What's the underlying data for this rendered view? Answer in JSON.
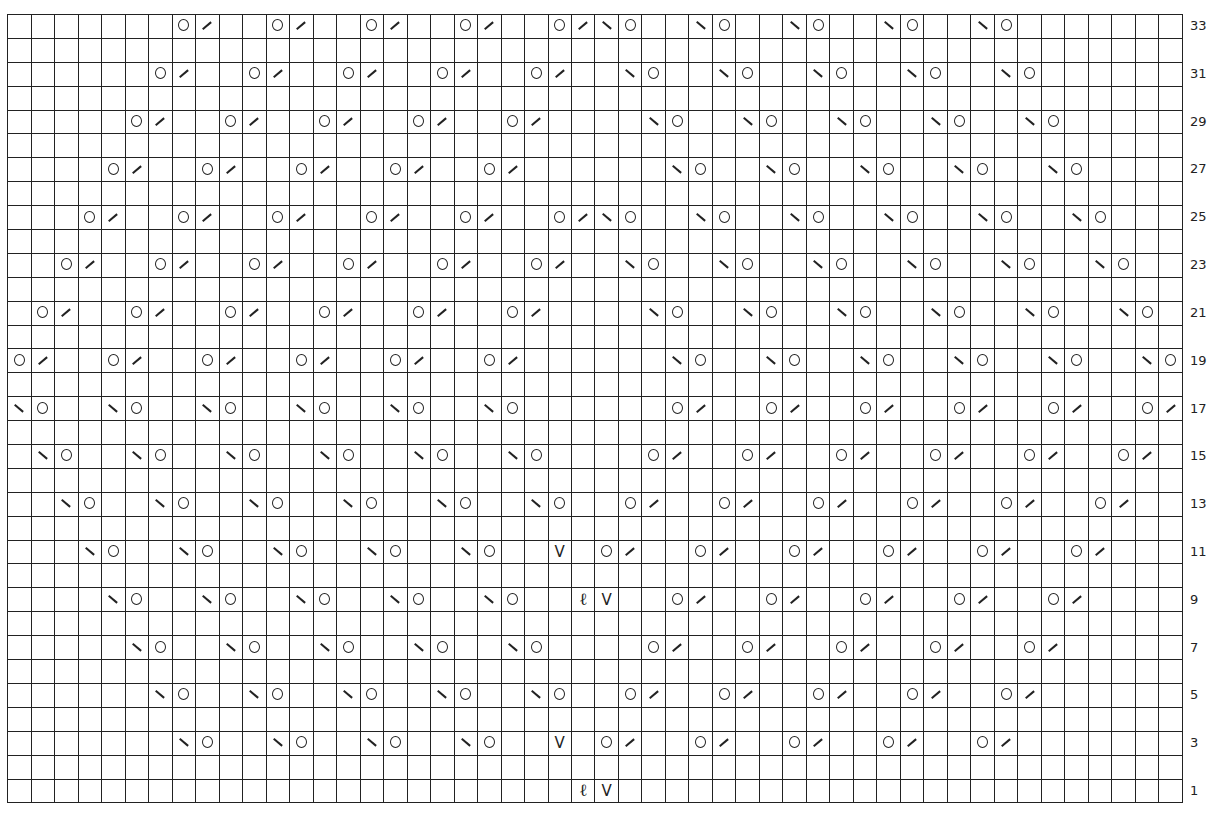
{
  "chart": {
    "type": "knitting-chart",
    "columns": 50,
    "rows": 33,
    "legend_symbols": {
      "o": "yarn-over",
      "/": "k2tog (right-leaning decrease)",
      "\\": "ssk (left-leaning decrease)",
      "V": "slip stitch",
      "ell": "twisted stitch"
    },
    "row_labels": [
      33,
      31,
      29,
      27,
      25,
      23,
      21,
      19,
      17,
      15,
      13,
      11,
      9,
      7,
      5,
      3,
      1
    ],
    "symbols": {
      "33": [
        [
          7,
          "o"
        ],
        [
          8,
          "/"
        ],
        [
          11,
          "o"
        ],
        [
          12,
          "/"
        ],
        [
          15,
          "o"
        ],
        [
          16,
          "/"
        ],
        [
          19,
          "o"
        ],
        [
          20,
          "/"
        ],
        [
          23,
          "o"
        ],
        [
          24,
          "/"
        ],
        [
          25,
          "\\"
        ],
        [
          26,
          "o"
        ],
        [
          29,
          "\\"
        ],
        [
          30,
          "o"
        ],
        [
          33,
          "\\"
        ],
        [
          34,
          "o"
        ],
        [
          37,
          "\\"
        ],
        [
          38,
          "o"
        ],
        [
          41,
          "\\"
        ],
        [
          42,
          "o"
        ]
      ],
      "31": [
        [
          6,
          "o"
        ],
        [
          7,
          "/"
        ],
        [
          10,
          "o"
        ],
        [
          11,
          "/"
        ],
        [
          14,
          "o"
        ],
        [
          15,
          "/"
        ],
        [
          18,
          "o"
        ],
        [
          19,
          "/"
        ],
        [
          22,
          "o"
        ],
        [
          23,
          "/"
        ],
        [
          26,
          "\\"
        ],
        [
          27,
          "o"
        ],
        [
          30,
          "\\"
        ],
        [
          31,
          "o"
        ],
        [
          34,
          "\\"
        ],
        [
          35,
          "o"
        ],
        [
          38,
          "\\"
        ],
        [
          39,
          "o"
        ],
        [
          42,
          "\\"
        ],
        [
          43,
          "o"
        ]
      ],
      "29": [
        [
          5,
          "o"
        ],
        [
          6,
          "/"
        ],
        [
          9,
          "o"
        ],
        [
          10,
          "/"
        ],
        [
          13,
          "o"
        ],
        [
          14,
          "/"
        ],
        [
          17,
          "o"
        ],
        [
          18,
          "/"
        ],
        [
          21,
          "o"
        ],
        [
          22,
          "/"
        ],
        [
          27,
          "\\"
        ],
        [
          28,
          "o"
        ],
        [
          31,
          "\\"
        ],
        [
          32,
          "o"
        ],
        [
          35,
          "\\"
        ],
        [
          36,
          "o"
        ],
        [
          39,
          "\\"
        ],
        [
          40,
          "o"
        ],
        [
          43,
          "\\"
        ],
        [
          44,
          "o"
        ]
      ],
      "27": [
        [
          4,
          "o"
        ],
        [
          5,
          "/"
        ],
        [
          8,
          "o"
        ],
        [
          9,
          "/"
        ],
        [
          12,
          "o"
        ],
        [
          13,
          "/"
        ],
        [
          16,
          "o"
        ],
        [
          17,
          "/"
        ],
        [
          20,
          "o"
        ],
        [
          21,
          "/"
        ],
        [
          28,
          "\\"
        ],
        [
          29,
          "o"
        ],
        [
          32,
          "\\"
        ],
        [
          33,
          "o"
        ],
        [
          36,
          "\\"
        ],
        [
          37,
          "o"
        ],
        [
          40,
          "\\"
        ],
        [
          41,
          "o"
        ],
        [
          44,
          "\\"
        ],
        [
          45,
          "o"
        ]
      ],
      "25": [
        [
          3,
          "o"
        ],
        [
          4,
          "/"
        ],
        [
          7,
          "o"
        ],
        [
          8,
          "/"
        ],
        [
          11,
          "o"
        ],
        [
          12,
          "/"
        ],
        [
          15,
          "o"
        ],
        [
          16,
          "/"
        ],
        [
          19,
          "o"
        ],
        [
          20,
          "/"
        ],
        [
          23,
          "o"
        ],
        [
          24,
          "/"
        ],
        [
          25,
          "\\"
        ],
        [
          26,
          "o"
        ],
        [
          29,
          "\\"
        ],
        [
          30,
          "o"
        ],
        [
          33,
          "\\"
        ],
        [
          34,
          "o"
        ],
        [
          37,
          "\\"
        ],
        [
          38,
          "o"
        ],
        [
          41,
          "\\"
        ],
        [
          42,
          "o"
        ],
        [
          45,
          "\\"
        ],
        [
          46,
          "o"
        ]
      ],
      "23": [
        [
          2,
          "o"
        ],
        [
          3,
          "/"
        ],
        [
          6,
          "o"
        ],
        [
          7,
          "/"
        ],
        [
          10,
          "o"
        ],
        [
          11,
          "/"
        ],
        [
          14,
          "o"
        ],
        [
          15,
          "/"
        ],
        [
          18,
          "o"
        ],
        [
          19,
          "/"
        ],
        [
          22,
          "o"
        ],
        [
          23,
          "/"
        ],
        [
          26,
          "\\"
        ],
        [
          27,
          "o"
        ],
        [
          30,
          "\\"
        ],
        [
          31,
          "o"
        ],
        [
          34,
          "\\"
        ],
        [
          35,
          "o"
        ],
        [
          38,
          "\\"
        ],
        [
          39,
          "o"
        ],
        [
          42,
          "\\"
        ],
        [
          43,
          "o"
        ],
        [
          46,
          "\\"
        ],
        [
          47,
          "o"
        ]
      ],
      "21": [
        [
          1,
          "o"
        ],
        [
          2,
          "/"
        ],
        [
          5,
          "o"
        ],
        [
          6,
          "/"
        ],
        [
          9,
          "o"
        ],
        [
          10,
          "/"
        ],
        [
          13,
          "o"
        ],
        [
          14,
          "/"
        ],
        [
          17,
          "o"
        ],
        [
          18,
          "/"
        ],
        [
          21,
          "o"
        ],
        [
          22,
          "/"
        ],
        [
          27,
          "\\"
        ],
        [
          28,
          "o"
        ],
        [
          31,
          "\\"
        ],
        [
          32,
          "o"
        ],
        [
          35,
          "\\"
        ],
        [
          36,
          "o"
        ],
        [
          39,
          "\\"
        ],
        [
          40,
          "o"
        ],
        [
          43,
          "\\"
        ],
        [
          44,
          "o"
        ],
        [
          47,
          "\\"
        ],
        [
          48,
          "o"
        ]
      ],
      "19": [
        [
          0,
          "o"
        ],
        [
          1,
          "/"
        ],
        [
          4,
          "o"
        ],
        [
          5,
          "/"
        ],
        [
          8,
          "o"
        ],
        [
          9,
          "/"
        ],
        [
          12,
          "o"
        ],
        [
          13,
          "/"
        ],
        [
          16,
          "o"
        ],
        [
          17,
          "/"
        ],
        [
          20,
          "o"
        ],
        [
          21,
          "/"
        ],
        [
          28,
          "\\"
        ],
        [
          29,
          "o"
        ],
        [
          32,
          "\\"
        ],
        [
          33,
          "o"
        ],
        [
          36,
          "\\"
        ],
        [
          37,
          "o"
        ],
        [
          40,
          "\\"
        ],
        [
          41,
          "o"
        ],
        [
          44,
          "\\"
        ],
        [
          45,
          "o"
        ],
        [
          48,
          "\\"
        ],
        [
          49,
          "o"
        ]
      ],
      "17": [
        [
          0,
          "\\"
        ],
        [
          1,
          "o"
        ],
        [
          4,
          "\\"
        ],
        [
          5,
          "o"
        ],
        [
          8,
          "\\"
        ],
        [
          9,
          "o"
        ],
        [
          12,
          "\\"
        ],
        [
          13,
          "o"
        ],
        [
          16,
          "\\"
        ],
        [
          17,
          "o"
        ],
        [
          20,
          "\\"
        ],
        [
          21,
          "o"
        ],
        [
          28,
          "o"
        ],
        [
          29,
          "/"
        ],
        [
          32,
          "o"
        ],
        [
          33,
          "/"
        ],
        [
          36,
          "o"
        ],
        [
          37,
          "/"
        ],
        [
          40,
          "o"
        ],
        [
          41,
          "/"
        ],
        [
          44,
          "o"
        ],
        [
          45,
          "/"
        ],
        [
          48,
          "o"
        ],
        [
          49,
          "/"
        ]
      ],
      "15": [
        [
          1,
          "\\"
        ],
        [
          2,
          "o"
        ],
        [
          5,
          "\\"
        ],
        [
          6,
          "o"
        ],
        [
          9,
          "\\"
        ],
        [
          10,
          "o"
        ],
        [
          13,
          "\\"
        ],
        [
          14,
          "o"
        ],
        [
          17,
          "\\"
        ],
        [
          18,
          "o"
        ],
        [
          21,
          "\\"
        ],
        [
          22,
          "o"
        ],
        [
          27,
          "o"
        ],
        [
          28,
          "/"
        ],
        [
          31,
          "o"
        ],
        [
          32,
          "/"
        ],
        [
          35,
          "o"
        ],
        [
          36,
          "/"
        ],
        [
          39,
          "o"
        ],
        [
          40,
          "/"
        ],
        [
          43,
          "o"
        ],
        [
          44,
          "/"
        ],
        [
          47,
          "o"
        ],
        [
          48,
          "/"
        ]
      ],
      "13": [
        [
          2,
          "\\"
        ],
        [
          3,
          "o"
        ],
        [
          6,
          "\\"
        ],
        [
          7,
          "o"
        ],
        [
          10,
          "\\"
        ],
        [
          11,
          "o"
        ],
        [
          14,
          "\\"
        ],
        [
          15,
          "o"
        ],
        [
          18,
          "\\"
        ],
        [
          19,
          "o"
        ],
        [
          22,
          "\\"
        ],
        [
          23,
          "o"
        ],
        [
          26,
          "o"
        ],
        [
          27,
          "/"
        ],
        [
          30,
          "o"
        ],
        [
          31,
          "/"
        ],
        [
          34,
          "o"
        ],
        [
          35,
          "/"
        ],
        [
          38,
          "o"
        ],
        [
          39,
          "/"
        ],
        [
          42,
          "o"
        ],
        [
          43,
          "/"
        ],
        [
          46,
          "o"
        ],
        [
          47,
          "/"
        ]
      ],
      "11": [
        [
          3,
          "\\"
        ],
        [
          4,
          "o"
        ],
        [
          7,
          "\\"
        ],
        [
          8,
          "o"
        ],
        [
          11,
          "\\"
        ],
        [
          12,
          "o"
        ],
        [
          15,
          "\\"
        ],
        [
          16,
          "o"
        ],
        [
          19,
          "\\"
        ],
        [
          20,
          "o"
        ],
        [
          23,
          "V"
        ],
        [
          25,
          "o"
        ],
        [
          26,
          "/"
        ],
        [
          29,
          "o"
        ],
        [
          30,
          "/"
        ],
        [
          33,
          "o"
        ],
        [
          34,
          "/"
        ],
        [
          37,
          "o"
        ],
        [
          38,
          "/"
        ],
        [
          41,
          "o"
        ],
        [
          42,
          "/"
        ],
        [
          45,
          "o"
        ],
        [
          46,
          "/"
        ]
      ],
      "9": [
        [
          4,
          "\\"
        ],
        [
          5,
          "o"
        ],
        [
          8,
          "\\"
        ],
        [
          9,
          "o"
        ],
        [
          12,
          "\\"
        ],
        [
          13,
          "o"
        ],
        [
          16,
          "\\"
        ],
        [
          17,
          "o"
        ],
        [
          20,
          "\\"
        ],
        [
          21,
          "o"
        ],
        [
          24,
          "ell"
        ],
        [
          25,
          "V"
        ],
        [
          28,
          "o"
        ],
        [
          29,
          "/"
        ],
        [
          32,
          "o"
        ],
        [
          33,
          "/"
        ],
        [
          36,
          "o"
        ],
        [
          37,
          "/"
        ],
        [
          40,
          "o"
        ],
        [
          41,
          "/"
        ],
        [
          44,
          "o"
        ],
        [
          45,
          "/"
        ]
      ],
      "7": [
        [
          5,
          "\\"
        ],
        [
          6,
          "o"
        ],
        [
          9,
          "\\"
        ],
        [
          10,
          "o"
        ],
        [
          13,
          "\\"
        ],
        [
          14,
          "o"
        ],
        [
          17,
          "\\"
        ],
        [
          18,
          "o"
        ],
        [
          21,
          "\\"
        ],
        [
          22,
          "o"
        ],
        [
          27,
          "o"
        ],
        [
          28,
          "/"
        ],
        [
          31,
          "o"
        ],
        [
          32,
          "/"
        ],
        [
          35,
          "o"
        ],
        [
          36,
          "/"
        ],
        [
          39,
          "o"
        ],
        [
          40,
          "/"
        ],
        [
          43,
          "o"
        ],
        [
          44,
          "/"
        ]
      ],
      "5": [
        [
          6,
          "\\"
        ],
        [
          7,
          "o"
        ],
        [
          10,
          "\\"
        ],
        [
          11,
          "o"
        ],
        [
          14,
          "\\"
        ],
        [
          15,
          "o"
        ],
        [
          18,
          "\\"
        ],
        [
          19,
          "o"
        ],
        [
          22,
          "\\"
        ],
        [
          23,
          "o"
        ],
        [
          26,
          "o"
        ],
        [
          27,
          "/"
        ],
        [
          30,
          "o"
        ],
        [
          31,
          "/"
        ],
        [
          34,
          "o"
        ],
        [
          35,
          "/"
        ],
        [
          38,
          "o"
        ],
        [
          39,
          "/"
        ],
        [
          42,
          "o"
        ],
        [
          43,
          "/"
        ]
      ],
      "3": [
        [
          7,
          "\\"
        ],
        [
          8,
          "o"
        ],
        [
          11,
          "\\"
        ],
        [
          12,
          "o"
        ],
        [
          15,
          "\\"
        ],
        [
          16,
          "o"
        ],
        [
          19,
          "\\"
        ],
        [
          20,
          "o"
        ],
        [
          23,
          "V"
        ],
        [
          25,
          "o"
        ],
        [
          26,
          "/"
        ],
        [
          29,
          "o"
        ],
        [
          30,
          "/"
        ],
        [
          33,
          "o"
        ],
        [
          34,
          "/"
        ],
        [
          37,
          "o"
        ],
        [
          38,
          "/"
        ],
        [
          41,
          "o"
        ],
        [
          42,
          "/"
        ]
      ],
      "1": [
        [
          24,
          "ell"
        ],
        [
          25,
          "V"
        ]
      ]
    },
    "glyphs": {
      "V": "V",
      "ell": "ℓ"
    }
  }
}
